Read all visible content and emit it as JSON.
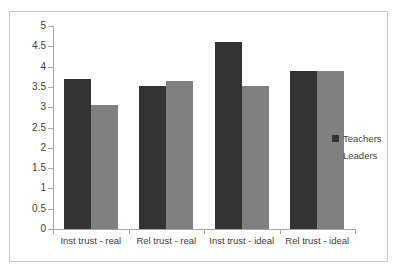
{
  "chart_data": {
    "type": "bar",
    "title": "",
    "xlabel": "",
    "ylabel": "",
    "ylim": [
      0,
      5
    ],
    "ytick_step": 0.5,
    "yticks": [
      "5",
      "4.5",
      "4",
      "3.5",
      "3",
      "2.5",
      "2",
      "1.5",
      "1",
      "0.5",
      "0"
    ],
    "grid": false,
    "legend_position": "right",
    "categories": [
      "Inst trust - real",
      "Rel trust - real",
      "Inst trust - ideal",
      "Rel trust - ideal"
    ],
    "series": [
      {
        "name": "Teachers",
        "color": "#333333",
        "values": [
          3.7,
          3.52,
          4.6,
          3.88
        ]
      },
      {
        "name": "Leaders",
        "color": "#808080",
        "values": [
          3.05,
          3.65,
          3.53,
          3.88
        ]
      }
    ]
  },
  "legend": {
    "items": [
      {
        "label": "Teachers",
        "color": "#333333"
      },
      {
        "label": "Leaders",
        "color": "#808080"
      }
    ]
  },
  "colors": {
    "teachers": "#333333",
    "leaders": "#808080",
    "axis": "#a6a6a6",
    "border": "#c9c9c9",
    "text": "#404040",
    "background": "#ffffff"
  }
}
